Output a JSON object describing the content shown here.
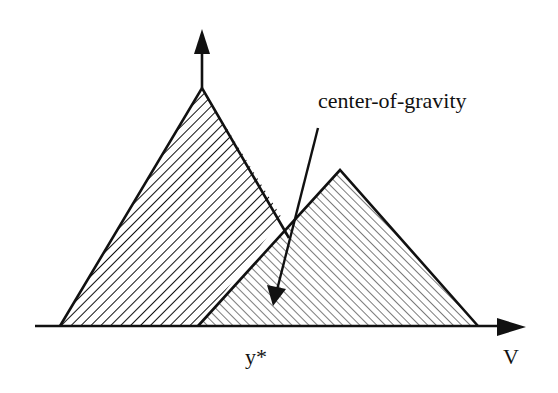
{
  "diagram": {
    "labels": {
      "annotation": "center-of-gravity",
      "output_value": "y*",
      "axis": "V"
    },
    "shapes": [
      {
        "name": "left-membership-triangle",
        "vertices": [
          [
            60,
            326
          ],
          [
            202,
            88
          ],
          [
            289,
            228
          ]
        ],
        "hatch": "forward-diagonal",
        "hatch_spacing": 7
      },
      {
        "name": "right-membership-triangle",
        "vertices": [
          [
            198,
            326
          ],
          [
            340,
            170
          ],
          [
            478,
            326
          ]
        ],
        "hatch": "back-diagonal",
        "hatch_spacing": 6
      }
    ],
    "colors": {
      "stroke": "#111111",
      "background": "#ffffff"
    }
  }
}
